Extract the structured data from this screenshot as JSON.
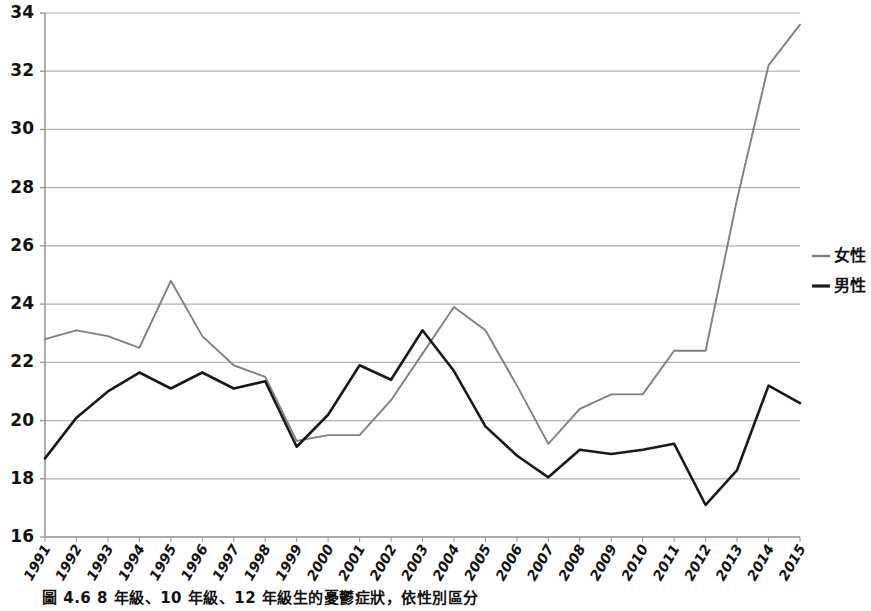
{
  "figure": {
    "caption": "圖 4.6  8 年級、10 年級、12 年級生的憂鬱症狀，依性別區分"
  },
  "legend": {
    "position": "right",
    "entries": [
      {
        "label": "女性",
        "color": "#808080",
        "marker": "line"
      },
      {
        "label": "男性",
        "color": "#1a1a1a",
        "marker": "line"
      }
    ]
  },
  "colors": {
    "female_line": "#808080",
    "male_line": "#1a1a1a",
    "gridline": "#b0b0b0",
    "axis": "#9a9a9a",
    "text": "#111111",
    "background": "#ffffff"
  },
  "chart_data": {
    "type": "line",
    "title": "",
    "xlabel": "",
    "ylabel": "",
    "grid": true,
    "legend_position": "right",
    "ylim": [
      16,
      34
    ],
    "yticks": [
      16,
      18,
      20,
      22,
      24,
      26,
      28,
      30,
      32,
      34
    ],
    "x": [
      "1991",
      "1992",
      "1993",
      "1994",
      "1995",
      "1996",
      "1997",
      "1998",
      "1999",
      "2000",
      "2001",
      "2002",
      "2003",
      "2004",
      "2005",
      "2006",
      "2007",
      "2008",
      "2009",
      "2010",
      "2011",
      "2012",
      "2013",
      "2014",
      "2015"
    ],
    "series": [
      {
        "name": "女性",
        "color": "#808080",
        "values": [
          22.8,
          23.1,
          22.9,
          22.5,
          24.8,
          22.9,
          21.9,
          21.5,
          19.3,
          19.5,
          19.5,
          20.7,
          22.3,
          23.9,
          23.1,
          21.2,
          19.2,
          20.4,
          20.9,
          20.9,
          22.4,
          22.4,
          27.6,
          32.2,
          33.6
        ]
      },
      {
        "name": "男性",
        "color": "#1a1a1a",
        "values": [
          18.7,
          20.1,
          21.0,
          21.65,
          21.1,
          21.65,
          21.1,
          21.35,
          19.1,
          20.2,
          21.9,
          21.4,
          23.1,
          21.7,
          19.8,
          18.8,
          18.05,
          19.0,
          18.85,
          19.0,
          19.2,
          17.1,
          18.3,
          21.2,
          20.6
        ]
      }
    ]
  }
}
